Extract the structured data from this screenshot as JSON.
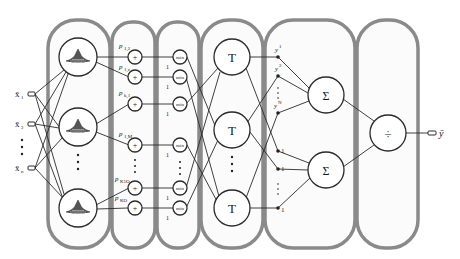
{
  "diagram": {
    "layers": [
      {
        "name": "fuzzification-layer",
        "node_symbol": "gaussian-membership",
        "nodes": 3
      },
      {
        "name": "product-layer",
        "node_symbol": "+",
        "nodes": 6
      },
      {
        "name": "min-layer",
        "node_symbol": "min",
        "nodes": 6
      },
      {
        "name": "T-layer",
        "node_symbol": "T",
        "nodes": 3
      },
      {
        "name": "sum-layer",
        "node_symbol": "Σ",
        "nodes": 2
      },
      {
        "name": "division-layer",
        "node_symbol": "÷",
        "nodes": 1
      }
    ],
    "inputs": [
      {
        "label": "x̄",
        "sub": "1"
      },
      {
        "label": "x̄",
        "sub": "2"
      },
      {
        "label": "x̄",
        "sub": "n"
      }
    ],
    "input_ellipsis": "⋮",
    "output": {
      "label": "ȳ"
    },
    "product_weights": [
      {
        "label": "p",
        "sub": "1,2"
      },
      {
        "label": "p",
        "sub": "1,z"
      },
      {
        "label": "p",
        "sub": "k,1"
      },
      {
        "label": "p",
        "sub": "1,M"
      },
      {
        "label": "p",
        "sub": "K1O"
      },
      {
        "label": "p",
        "sub": "KO"
      }
    ],
    "product_symbol": "+",
    "min_symbol": "min",
    "min_bias_label": "1",
    "t_symbol": "T",
    "sum_symbol": "Σ",
    "div_symbol": "÷",
    "y_weights": [
      {
        "label": "y",
        "sup": "1"
      },
      {
        "label": "y",
        "sup": "2"
      },
      {
        "label": "y",
        "sup": "N"
      }
    ],
    "unit_weights": [
      "1",
      "1",
      "1"
    ],
    "ellipsis": "⋮"
  }
}
